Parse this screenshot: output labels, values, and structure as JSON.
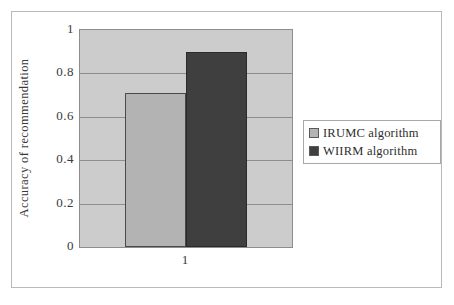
{
  "chart_data": {
    "type": "bar",
    "title": "",
    "subtitle": "",
    "xlabel": "",
    "ylabel": "Accuracy of recommendation",
    "categories": [
      "1"
    ],
    "series": [
      {
        "name": "IRUMC algorithm",
        "values": [
          0.71
        ],
        "color": "#b3b3b3"
      },
      {
        "name": "WIIRM algorithm",
        "values": [
          0.9
        ],
        "color": "#3f3f3f"
      }
    ],
    "ylim": [
      0,
      1
    ],
    "yticks": [
      0,
      0.2,
      0.4,
      0.6,
      0.8,
      1
    ],
    "ytick_labels": [
      "0",
      "0.2",
      "0.4",
      "0.6",
      "0.8",
      "1"
    ],
    "grid": true,
    "grid_axis": "y",
    "legend_position": "right",
    "plot_background": "#cccccc",
    "figure_background": "#ffffff",
    "axis_color": "#8d8d8d"
  },
  "legend": {
    "entries": [
      {
        "label": "IRUMC algorithm"
      },
      {
        "label": "WIIRM algorithm"
      }
    ]
  },
  "axes": {
    "y_title": "Accuracy of recommendation",
    "y_tick_labels": [
      "1",
      "0.8",
      "0.6",
      "0.4",
      "0.2",
      "0"
    ],
    "x_tick_labels": [
      "1"
    ]
  }
}
